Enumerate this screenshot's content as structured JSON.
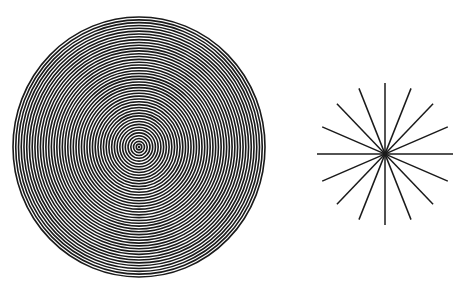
{
  "figure": {
    "background": "#ffffff",
    "ink": "#1a1a1a",
    "concentric_circles": {
      "label": "concentric-circles-pattern",
      "center": [
        139,
        147
      ],
      "outer_radius_x": 126,
      "outer_radius_y": 130,
      "ring_count": 46,
      "stroke_width": 1.6,
      "inner_dot_radius": 1.2
    },
    "radial_star": {
      "label": "radial-lines-star",
      "center": [
        385,
        154
      ],
      "radius_x": 68,
      "radius_y": 71,
      "ray_count": 16,
      "angle_step_deg": 22.5,
      "stroke_width": 1.5
    }
  }
}
